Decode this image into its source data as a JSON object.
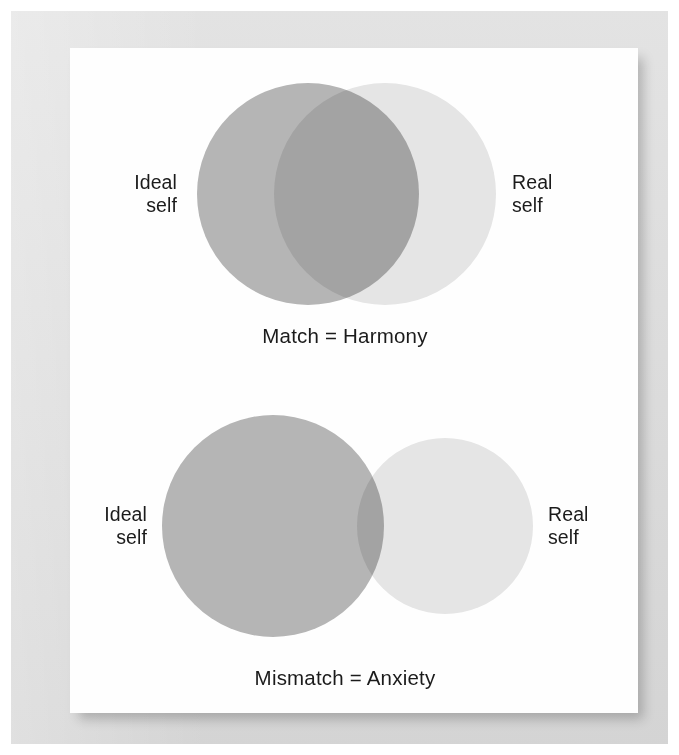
{
  "page": {
    "background_color": "#ffffff",
    "mat_color": "#dbdbdb",
    "card_color": "#fefefe"
  },
  "chart_data": {
    "type": "diagram",
    "diagram_kind": "venn",
    "title": "",
    "figures": [
      {
        "id": "match",
        "caption": "Match = Harmony",
        "sets": [
          {
            "name": "Ideal self",
            "label": "Ideal\nself",
            "side": "left",
            "color": "#b6b6b6",
            "center_x": 308,
            "center_y": 194,
            "radius": 111
          },
          {
            "name": "Real self",
            "label": "Real\nself",
            "side": "right",
            "color": "#e6e6e6",
            "center_x": 385,
            "center_y": 194,
            "radius": 111
          }
        ],
        "overlap": "large",
        "overlap_color": "#c9c9c9",
        "meaning": "High overlap between ideal self and real self produces harmony"
      },
      {
        "id": "mismatch",
        "caption": "Mismatch = Anxiety",
        "sets": [
          {
            "name": "Ideal self",
            "label": "Ideal\nself",
            "side": "left",
            "color": "#b6b6b6",
            "center_x": 273,
            "center_y": 526,
            "radius": 111
          },
          {
            "name": "Real self",
            "label": "Real\nself",
            "side": "right",
            "color": "#e6e6e6",
            "center_x": 445,
            "center_y": 526,
            "radius": 88
          }
        ],
        "overlap": "small",
        "overlap_color": "#c9c9c9",
        "meaning": "Low overlap between ideal self and real self produces anxiety"
      }
    ]
  }
}
